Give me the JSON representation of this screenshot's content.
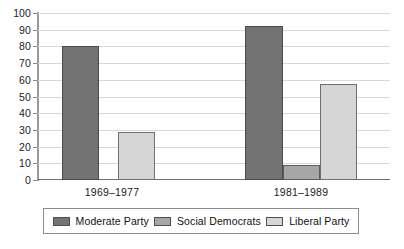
{
  "chart_data": {
    "type": "bar",
    "title": "",
    "subtitle": "",
    "xlabel": "",
    "ylabel": "",
    "categories": [
      "1969–1977",
      "1981–1989"
    ],
    "series": [
      {
        "name": "Moderate Party",
        "values": [
          81,
          93
        ],
        "color": "#737373"
      },
      {
        "name": "Social Democrats",
        "values": [
          0,
          9
        ],
        "color": "#a6a6a6"
      },
      {
        "name": "Liberal Party",
        "values": [
          29,
          58
        ],
        "color": "#d6d6d6"
      }
    ],
    "ylim": [
      0,
      100
    ],
    "ytick_step": 10,
    "ytick_labels": [
      "0",
      "10",
      "20",
      "30",
      "40",
      "50",
      "60",
      "70",
      "80",
      "90",
      "100"
    ],
    "grid": true,
    "legend_position": "bottom"
  },
  "legend": {
    "items": [
      {
        "label": "Moderate Party"
      },
      {
        "label": "Social Democrats"
      },
      {
        "label": "Liberal Party"
      }
    ]
  },
  "axis": {
    "y_labels": [
      "100",
      "90",
      "80",
      "70",
      "60",
      "50",
      "40",
      "30",
      "20",
      "10",
      "0"
    ]
  },
  "categories": [
    {
      "label": "1969–1977"
    },
    {
      "label": "1981–1989"
    }
  ]
}
